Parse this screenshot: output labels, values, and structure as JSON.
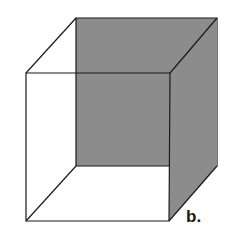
{
  "figure": {
    "label": "b.",
    "shaded_face": "back",
    "colors": {
      "shade": "#8c8c8c",
      "line": "#1a1a1a",
      "background": "#ffffff"
    }
  }
}
